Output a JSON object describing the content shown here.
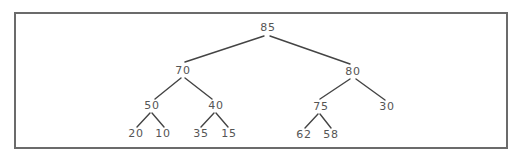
{
  "diagram": {
    "type": "binary-tree",
    "nodes": [
      {
        "id": "n0",
        "value": "85",
        "x": 268,
        "y": 28,
        "level": 0
      },
      {
        "id": "n1",
        "value": "70",
        "x": 183,
        "y": 71,
        "level": 1
      },
      {
        "id": "n2",
        "value": "80",
        "x": 353,
        "y": 72,
        "level": 1
      },
      {
        "id": "n3",
        "value": "50",
        "x": 152,
        "y": 106,
        "level": 2
      },
      {
        "id": "n4",
        "value": "40",
        "x": 216,
        "y": 106,
        "level": 2
      },
      {
        "id": "n5",
        "value": "75",
        "x": 321,
        "y": 107,
        "level": 2
      },
      {
        "id": "n6",
        "value": "30",
        "x": 387,
        "y": 107,
        "level": 2
      },
      {
        "id": "n7",
        "value": "20",
        "x": 136,
        "y": 134,
        "level": 3
      },
      {
        "id": "n8",
        "value": "10",
        "x": 163,
        "y": 134,
        "level": 3
      },
      {
        "id": "n9",
        "value": "35",
        "x": 201,
        "y": 134,
        "level": 3
      },
      {
        "id": "n10",
        "value": "15",
        "x": 229,
        "y": 134,
        "level": 3
      },
      {
        "id": "n11",
        "value": "62",
        "x": 304,
        "y": 135,
        "level": 3
      },
      {
        "id": "n12",
        "value": "58",
        "x": 331,
        "y": 135,
        "level": 3
      }
    ],
    "edges": [
      {
        "from": "85",
        "to": "70",
        "x1": 264,
        "y1": 36,
        "x2": 185,
        "y2": 62
      },
      {
        "from": "85",
        "to": "80",
        "x1": 270,
        "y1": 36,
        "x2": 350,
        "y2": 64
      },
      {
        "from": "70",
        "to": "50",
        "x1": 181,
        "y1": 78,
        "x2": 155,
        "y2": 99
      },
      {
        "from": "70",
        "to": "40",
        "x1": 185,
        "y1": 78,
        "x2": 212,
        "y2": 99
      },
      {
        "from": "80",
        "to": "75",
        "x1": 350,
        "y1": 79,
        "x2": 320,
        "y2": 99
      },
      {
        "from": "80",
        "to": "30",
        "x1": 356,
        "y1": 79,
        "x2": 385,
        "y2": 100
      },
      {
        "from": "50",
        "to": "20",
        "x1": 150,
        "y1": 113,
        "x2": 137,
        "y2": 127
      },
      {
        "from": "50",
        "to": "10",
        "x1": 152,
        "y1": 113,
        "x2": 164,
        "y2": 127
      },
      {
        "from": "40",
        "to": "35",
        "x1": 214,
        "y1": 113,
        "x2": 201,
        "y2": 127
      },
      {
        "from": "40",
        "to": "15",
        "x1": 216,
        "y1": 113,
        "x2": 228,
        "y2": 127
      },
      {
        "from": "75",
        "to": "62",
        "x1": 318,
        "y1": 114,
        "x2": 305,
        "y2": 128
      },
      {
        "from": "75",
        "to": "58",
        "x1": 320,
        "y1": 114,
        "x2": 331,
        "y2": 128
      }
    ]
  },
  "colors": {
    "border": "#6b6b6b",
    "edge": "#444444",
    "text": "#555555",
    "background": "#ffffff"
  }
}
